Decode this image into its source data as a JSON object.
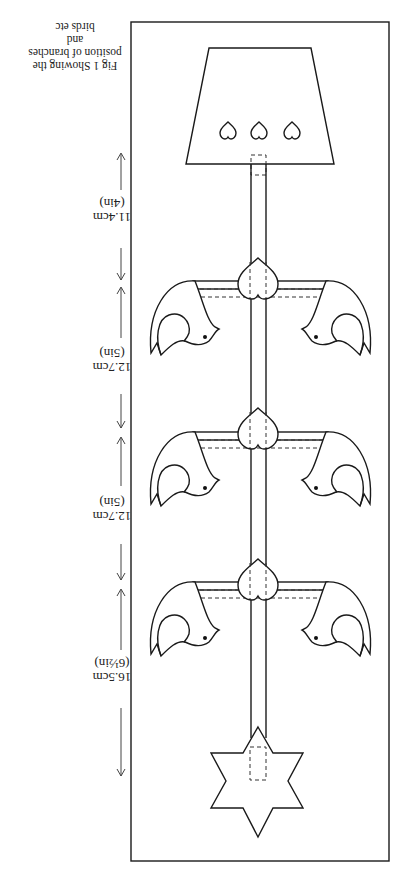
{
  "figure": {
    "caption_line1": "Fig 1  Showing the",
    "caption_line2": "position of branches and",
    "caption_line3": "birds etc",
    "orientation": "rotated 180°",
    "dimensions": [
      {
        "cm": "11.4cm",
        "in": "(4in)"
      },
      {
        "cm": "12.7cm",
        "in": "(5in)"
      },
      {
        "cm": "12.7cm",
        "in": "(5in)"
      },
      {
        "cm": "16.5cm",
        "in": "(6½in)"
      }
    ],
    "parts": [
      "lamp-shade base with three heart cut-outs",
      "central pole",
      "three branches each with heart and two birds",
      "six-pointed star"
    ]
  }
}
